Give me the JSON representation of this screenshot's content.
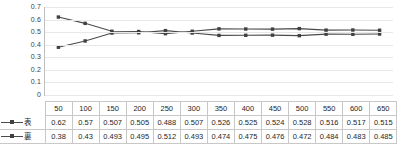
{
  "chart_data": {
    "type": "line",
    "title": "",
    "xlabel": "",
    "ylabel": "",
    "ylim": [
      0,
      0.7
    ],
    "ytick_step": 0.1,
    "grid": true,
    "legend_position": "table-left",
    "categories": [
      50,
      100,
      150,
      200,
      250,
      300,
      350,
      400,
      450,
      500,
      550,
      600,
      650
    ],
    "ytick_labels": [
      "0.7",
      "0.6",
      "0.5",
      "0.4",
      "0.3",
      "0.2",
      "0.1",
      "0"
    ],
    "ytick_values": [
      0.7,
      0.6,
      0.5,
      0.4,
      0.3,
      0.2,
      0.1,
      0
    ],
    "series": [
      {
        "name": "表",
        "color": "#4a4a4a",
        "marker": "square",
        "values": [
          0.62,
          0.57,
          0.507,
          0.505,
          0.488,
          0.507,
          0.526,
          0.525,
          0.524,
          0.528,
          0.516,
          0.517,
          0.515
        ]
      },
      {
        "name": "裏",
        "color": "#4a4a4a",
        "marker": "square",
        "values": [
          0.38,
          0.43,
          0.493,
          0.495,
          0.512,
          0.493,
          0.474,
          0.475,
          0.476,
          0.472,
          0.484,
          0.483,
          0.485
        ]
      }
    ]
  },
  "table": {
    "header": [
      "50",
      "100",
      "150",
      "200",
      "250",
      "300",
      "350",
      "400",
      "450",
      "500",
      "550",
      "600",
      "650"
    ],
    "rows": [
      {
        "label": "表",
        "cells": [
          "0.62",
          "0.57",
          "0.507",
          "0.505",
          "0.488",
          "0.507",
          "0.526",
          "0.525",
          "0.524",
          "0.528",
          "0.516",
          "0.517",
          "0.515"
        ]
      },
      {
        "label": "裏",
        "cells": [
          "0.38",
          "0.43",
          "0.493",
          "0.495",
          "0.512",
          "0.493",
          "0.474",
          "0.475",
          "0.476",
          "0.472",
          "0.484",
          "0.483",
          "0.485"
        ]
      }
    ]
  },
  "colors": {
    "series_line": "#4a4a4a",
    "marker": "#404040",
    "gridline": "#e8e8e8",
    "axis": "#bfbfbf",
    "table_border": "#c8c8c8",
    "text": "#262626",
    "axis_text": "#404040"
  }
}
